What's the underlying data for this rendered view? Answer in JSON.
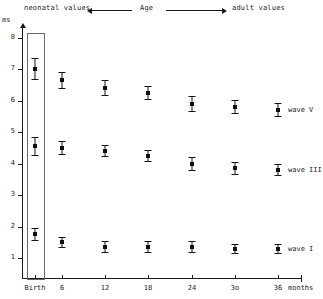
{
  "header": {
    "neonatal_label": "neonatal values",
    "age_label": "Age",
    "adult_label": "adult values",
    "left_arrow_icon": "arrow-left-icon",
    "right_arrow_icon": "arrow-right-icon"
  },
  "chart_data": {
    "type": "scatter",
    "title": "",
    "subtitle": "",
    "xlabel": "months",
    "ylabel": "ms",
    "x_tick_labels": [
      "Birth",
      "6",
      "12",
      "18",
      "24",
      "3o",
      "36"
    ],
    "x": [
      0,
      6,
      12,
      18,
      24,
      30,
      36
    ],
    "y_tick_labels": [
      "8",
      "7",
      "6",
      "5",
      "4",
      "3",
      "2",
      "1"
    ],
    "ylim": [
      0,
      8.3
    ],
    "xlim": [
      -3,
      39
    ],
    "grid": false,
    "legend_position": "right-inline",
    "error_bars": true,
    "annotations": [
      "neonatal values",
      "Age",
      "adult values"
    ],
    "birth_highlight_box": true,
    "series": [
      {
        "name": "wave V",
        "label": "wave V",
        "values": [
          7.0,
          6.65,
          6.4,
          6.25,
          5.9,
          5.8,
          5.7
        ],
        "errors": [
          0.35,
          0.28,
          0.25,
          0.22,
          0.25,
          0.22,
          0.22
        ]
      },
      {
        "name": "wave III",
        "label": "wave III",
        "values": [
          4.55,
          4.5,
          4.4,
          4.25,
          4.0,
          3.85,
          3.8
        ],
        "errors": [
          0.3,
          0.22,
          0.2,
          0.2,
          0.22,
          0.2,
          0.2
        ]
      },
      {
        "name": "wave I",
        "label": "wave I",
        "values": [
          1.75,
          1.5,
          1.35,
          1.35,
          1.35,
          1.3,
          1.3
        ],
        "errors": [
          0.22,
          0.18,
          0.18,
          0.18,
          0.18,
          0.16,
          0.16
        ]
      }
    ]
  },
  "colors": {
    "ink": "#1a1a1a",
    "marker": "#101010",
    "box_outline": "#6a6a6a",
    "background": "#ffffff"
  }
}
